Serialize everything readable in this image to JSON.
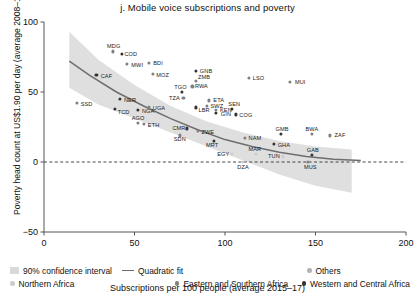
{
  "title": "j. Mobile voice subscriptions and poverty",
  "axes": {
    "xlabel": "Subscriptions per 100 people (average 2015–17)",
    "ylabel": "Poverty head count at US$1.90 per day (average 2008–17)",
    "xticks": [
      "0",
      "50",
      "100",
      "150",
      "200"
    ],
    "yticks": [
      "100",
      "50",
      "0",
      "−50"
    ]
  },
  "legend": {
    "band": "90% confidence interval",
    "fit": "Quadratic fit",
    "others": "Others",
    "northern": "Northern Africa",
    "eastern": "Eastern and Southern Africa",
    "western": "Western and Central Africa"
  },
  "colors": {
    "band": "#d9d9d9",
    "fit": "#6e6e6e",
    "others": "#b3b3b3",
    "northern": "#cccccc",
    "eastern": "#808080",
    "western": "#333333",
    "axis": "#555555",
    "zeroline": "#333333"
  },
  "chart_data": {
    "type": "scatter",
    "title": "j. Mobile voice subscriptions and poverty",
    "xlabel": "Subscriptions per 100 people (average 2015–17)",
    "ylabel": "Poverty head count at US$1.90 per day (average 2008–17)",
    "xlim": [
      0,
      200
    ],
    "ylim": [
      -50,
      100
    ],
    "grid": false,
    "legend_position": "below",
    "legend_entries": [
      "90% confidence interval",
      "Quadratic fit",
      "Others",
      "Northern Africa",
      "Eastern and Southern Africa",
      "Western and Central Africa"
    ],
    "zero_reference_line": 0,
    "fit": {
      "kind": "quadratic",
      "points": [
        {
          "x": 14,
          "y": 72
        },
        {
          "x": 25,
          "y": 62
        },
        {
          "x": 40,
          "y": 50
        },
        {
          "x": 55,
          "y": 40
        },
        {
          "x": 70,
          "y": 31
        },
        {
          "x": 85,
          "y": 23
        },
        {
          "x": 100,
          "y": 16
        },
        {
          "x": 115,
          "y": 11
        },
        {
          "x": 130,
          "y": 7
        },
        {
          "x": 145,
          "y": 4
        },
        {
          "x": 160,
          "y": 2
        },
        {
          "x": 175,
          "y": 1
        }
      ]
    },
    "confidence_band": {
      "level": 90,
      "upper": [
        {
          "x": 14,
          "y": 93
        },
        {
          "x": 30,
          "y": 73
        },
        {
          "x": 50,
          "y": 55
        },
        {
          "x": 70,
          "y": 40
        },
        {
          "x": 90,
          "y": 29
        },
        {
          "x": 110,
          "y": 21
        },
        {
          "x": 130,
          "y": 15
        },
        {
          "x": 150,
          "y": 11
        },
        {
          "x": 170,
          "y": 9
        }
      ],
      "lower": [
        {
          "x": 14,
          "y": 53
        },
        {
          "x": 30,
          "y": 41
        },
        {
          "x": 50,
          "y": 31
        },
        {
          "x": 70,
          "y": 21
        },
        {
          "x": 90,
          "y": 11
        },
        {
          "x": 110,
          "y": 1
        },
        {
          "x": 130,
          "y": -9
        },
        {
          "x": 150,
          "y": -17
        },
        {
          "x": 170,
          "y": -22
        }
      ]
    },
    "series": [
      {
        "name": "Western and Central Africa",
        "color": "#333333",
        "points": [
          {
            "label": "CAF",
            "x": 29,
            "y": 62
          },
          {
            "label": "COD",
            "x": 43,
            "y": 77
          },
          {
            "label": "NER",
            "x": 42,
            "y": 45
          },
          {
            "label": "TCD",
            "x": 39,
            "y": 38
          },
          {
            "label": "NGA",
            "x": 52,
            "y": 37
          },
          {
            "label": "GNB",
            "x": 84,
            "y": 65
          },
          {
            "label": "TGO",
            "x": 76,
            "y": 50
          },
          {
            "label": "CMR",
            "x": 79,
            "y": 24
          },
          {
            "label": "LBR",
            "x": 84,
            "y": 39
          },
          {
            "label": "GIN",
            "x": 95,
            "y": 35
          },
          {
            "label": "SEN",
            "x": 104,
            "y": 38
          },
          {
            "label": "COG",
            "x": 106,
            "y": 34
          },
          {
            "label": "MRT",
            "x": 94,
            "y": 15
          },
          {
            "label": "GMB",
            "x": 131,
            "y": 20
          },
          {
            "label": "GHA",
            "x": 127,
            "y": 13
          },
          {
            "label": "GAB",
            "x": 148,
            "y": 5
          }
        ]
      },
      {
        "name": "Eastern and Southern Africa",
        "color": "#808080",
        "points": [
          {
            "label": "SSD",
            "x": 18,
            "y": 42
          },
          {
            "label": "MDG",
            "x": 38,
            "y": 79
          },
          {
            "label": "MWI",
            "x": 46,
            "y": 70
          },
          {
            "label": "BDI",
            "x": 58,
            "y": 71
          },
          {
            "label": "MOZ",
            "x": 60,
            "y": 63
          },
          {
            "label": "ZMB",
            "x": 84,
            "y": 58
          },
          {
            "label": "RWA",
            "x": 82,
            "y": 54
          },
          {
            "label": "TZA",
            "x": 77,
            "y": 46
          },
          {
            "label": "ETA",
            "x": 91,
            "y": 44
          },
          {
            "label": "SWZ",
            "x": 90,
            "y": 40
          },
          {
            "label": "KEN",
            "x": 95,
            "y": 37
          },
          {
            "label": "LSO",
            "x": 113,
            "y": 60
          },
          {
            "label": "MUI",
            "x": 136,
            "y": 57
          },
          {
            "label": "AGO",
            "x": 52,
            "y": 28
          },
          {
            "label": "ETH",
            "x": 55,
            "y": 27
          },
          {
            "label": "UGA",
            "x": 58,
            "y": 39
          },
          {
            "label": "SDN",
            "x": 75,
            "y": 19
          },
          {
            "label": "ZWE",
            "x": 85,
            "y": 22
          },
          {
            "label": "NAM",
            "x": 111,
            "y": 17
          },
          {
            "label": "BWA",
            "x": 148,
            "y": 20
          },
          {
            "label": "ZAF",
            "x": 158,
            "y": 19
          },
          {
            "label": "MUS",
            "x": 146,
            "y": 0
          }
        ]
      },
      {
        "name": "Northern Africa",
        "color": "#cccccc",
        "points": [
          {
            "label": "EGY",
            "x": 104,
            "y": 6
          },
          {
            "label": "MAR",
            "x": 117,
            "y": 6
          },
          {
            "label": "TUN",
            "x": 132,
            "y": 4
          },
          {
            "label": "DZA",
            "x": 110,
            "y": 0
          }
        ]
      }
    ]
  }
}
